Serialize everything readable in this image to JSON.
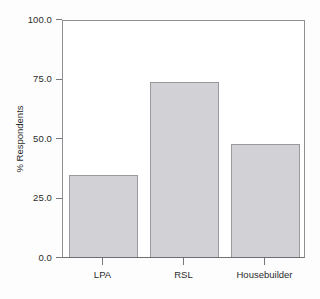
{
  "chart_data": {
    "type": "bar",
    "title": "",
    "subtitle": "",
    "xlabel": "",
    "ylabel": "% Respondents",
    "categories": [
      "LPA",
      "RSL",
      "Housebuilder"
    ],
    "values": [
      34.5,
      73.5,
      47.5
    ],
    "ylim": [
      0.0,
      100.0
    ],
    "ytick_labels": [
      "0.0",
      "25.0",
      "50.0",
      "75.0",
      "100.0"
    ],
    "ytick_values": [
      0.0,
      25.0,
      50.0,
      75.0,
      100.0
    ],
    "grid": false,
    "legend": false,
    "legend_position": "none",
    "bar_fill_color": "#d2d2d6",
    "bar_edge_color": "#9a9a9e",
    "axis_color": "#77787b",
    "text_color": "#2b2b2b",
    "background_color": "#ffffff"
  }
}
